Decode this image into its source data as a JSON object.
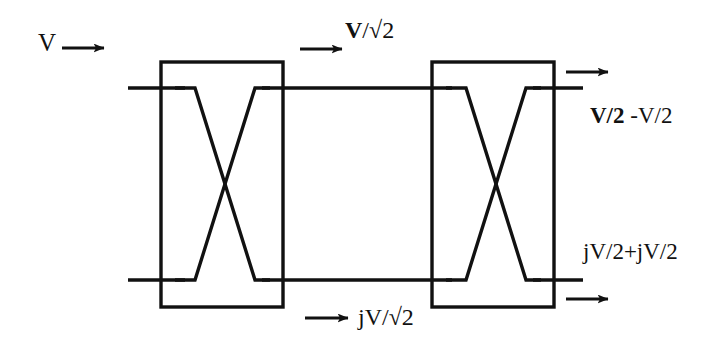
{
  "figure": {
    "kind": "circuit-schematic",
    "background_color": "#ffffff",
    "line_color": "#111111"
  },
  "labels": {
    "input_voltage": "V",
    "upper_branch": {
      "numerator": "V",
      "separator": "/",
      "radical": "√2"
    },
    "lower_branch": {
      "numerator": "jV",
      "separator": "/",
      "radical": "√2"
    },
    "output_top": {
      "first": "V/2",
      "second": "-V/2"
    },
    "output_bottom": {
      "text": "jV/2+jV/2"
    }
  },
  "components": [
    {
      "name": "coupler-left",
      "label": "",
      "x": 161,
      "y": 62,
      "width": 122,
      "height": 245
    },
    {
      "name": "coupler-right",
      "label": "",
      "x": 432,
      "y": 62,
      "width": 122,
      "height": 245
    }
  ],
  "arrows": [
    {
      "name": "arrow-input",
      "label": "V",
      "x1": 62,
      "y1": 48,
      "x2": 108,
      "y2": 48
    },
    {
      "name": "arrow-upper-mid",
      "label": "V/√2",
      "x1": 300,
      "y1": 49,
      "x2": 346,
      "y2": 49
    },
    {
      "name": "arrow-lower-mid",
      "label": "jV/√2",
      "x1": 305,
      "y1": 318,
      "x2": 352,
      "y2": 318
    },
    {
      "name": "arrow-output-top",
      "label": "V/2 -V/2",
      "x1": 566,
      "y1": 72,
      "x2": 612,
      "y2": 72
    },
    {
      "name": "arrow-output-bottom",
      "label": "jV/2+jV/2",
      "x1": 566,
      "y1": 299,
      "x2": 612,
      "y2": 299
    }
  ],
  "ports": {
    "top_rail_y": 88,
    "bottom_rail_y": 280,
    "input_x_start": 128,
    "output_x_end": 583
  }
}
